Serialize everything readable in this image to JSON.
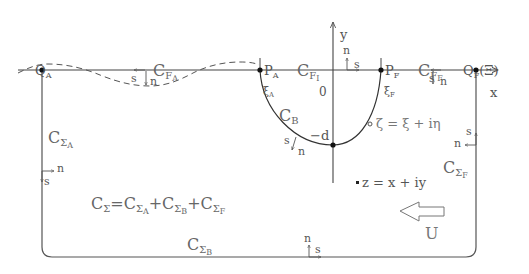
{
  "diagram": {
    "title": "",
    "colors": {
      "line": "#555555",
      "text": "#555555",
      "background": "#ffffff"
    },
    "axes": {
      "x_label": "x",
      "y_label": "y",
      "origin_label": "0"
    },
    "points": {
      "QA": {
        "main": "Q",
        "sub": "A"
      },
      "PA": {
        "main": "P",
        "sub": "A"
      },
      "PF": {
        "main": "P",
        "sub": "F"
      },
      "QF": {
        "main": "Q",
        "sub": "F",
        "suffix": "(Ξ)"
      },
      "xiA": {
        "main": "ξ",
        "sub": "A"
      },
      "xiF": {
        "main": "ξ",
        "sub": "F"
      },
      "depth": "−d"
    },
    "curves": {
      "CFA": {
        "main": "C",
        "sub": "F",
        "subsub": "A"
      },
      "CFI": {
        "main": "C",
        "sub": "F",
        "subsub": "I"
      },
      "CFF": {
        "main": "C",
        "sub": "F",
        "subsub": "F"
      },
      "CB": {
        "main": "C",
        "sub": "B"
      },
      "CSA": {
        "main": "C",
        "sub": "Σ",
        "subsub": "A"
      },
      "CSB": {
        "main": "C",
        "sub": "Σ",
        "subsub": "B"
      },
      "CSF": {
        "main": "C",
        "sub": "Σ",
        "subsub": "F"
      }
    },
    "equation": {
      "lhs_main": "C",
      "lhs_sub": "Σ",
      "eq": "=",
      "t1_main": "C",
      "t1_sub": "Σ",
      "t1_subsub": "A",
      "plus1": "+",
      "t2_main": "C",
      "t2_sub": "Σ",
      "t2_subsub": "B",
      "plus2": "+",
      "t3_main": "C",
      "t3_sub": "Σ",
      "t3_subsub": "F"
    },
    "zeta_label": "ζ = ξ + iη",
    "z_label": "z = x + iy",
    "flow_label": "U",
    "normal_label": "n",
    "tangent_label": "s"
  }
}
